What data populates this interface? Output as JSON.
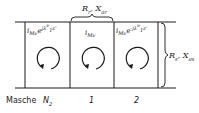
{
  "diagram": {
    "top_label": {
      "main": "R",
      "sub1": "r",
      "sep": ", X",
      "sub2": "σr"
    },
    "right_label": {
      "main": "R",
      "sub1": "s",
      "sep": ", X",
      "sub2": "σs"
    },
    "cells": [
      {
        "current_main": "i",
        "current_sub": "Mν",
        "exp": "e",
        "exp_sup": "jλ",
        "lambda_sup": "ν",
        "lambda_sub": "1",
        "eps": "ε'"
      },
      {
        "current_main": "i",
        "current_sub": "Mν"
      },
      {
        "current_main": "i",
        "current_sub": "Mν",
        "exp": "e",
        "exp_sup": "-jλ",
        "lambda_sup": "ν",
        "lambda_sub": "1",
        "eps": "ε'"
      }
    ],
    "bottom_labels": {
      "masche": "Masche",
      "n_main": "N",
      "n_sub": "2",
      "mesh1": "1",
      "mesh2": "2"
    }
  }
}
